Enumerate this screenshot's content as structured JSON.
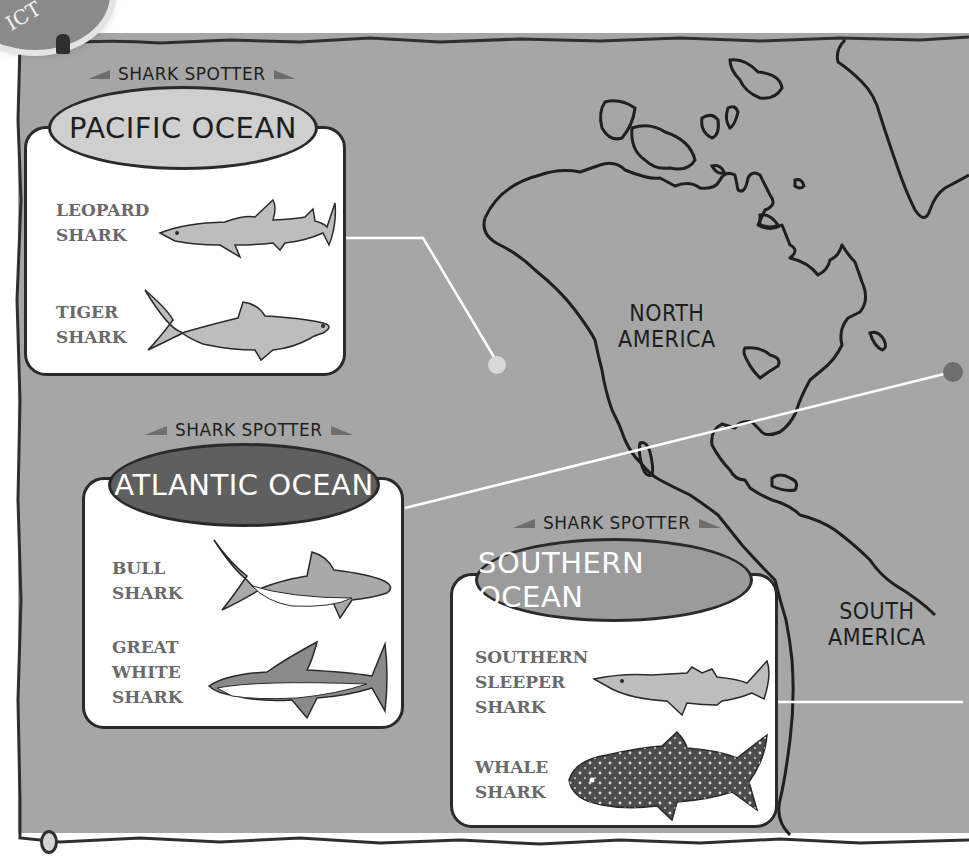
{
  "page": {
    "corner_badge_text": "ICT",
    "top_caption": "",
    "colors": {
      "ocean": "#a6a6a6",
      "card": "#ffffff",
      "outline": "#2a2a2a",
      "pacific_header": "#cfcfcf",
      "atlantic_header": "#5f5f5f",
      "southern_header": "#9b9b9b",
      "shark_label": "#6a6a6a",
      "pointer_line": "#ffffff"
    }
  },
  "map": {
    "continents": [
      {
        "label_line1": "NORTH",
        "label_line2": "AMERICA"
      },
      {
        "label_line1": "SOUTH",
        "label_line2": "AMERICA"
      }
    ],
    "markers": [
      {
        "name": "pacific-marker",
        "color": "#d9d9d9"
      },
      {
        "name": "atlantic-marker",
        "color": "#6e6e6e"
      },
      {
        "name": "southern-marker",
        "color": "#e0e0e0"
      }
    ]
  },
  "cards": {
    "pacific": {
      "spotter": "SHARK SPOTTER",
      "title": "PACIFIC OCEAN",
      "sharks": [
        {
          "line1": "LEOPARD",
          "line2": "SHARK",
          "icon": "leopard-shark-icon"
        },
        {
          "line1": "TIGER",
          "line2": "SHARK",
          "icon": "tiger-shark-icon"
        }
      ]
    },
    "atlantic": {
      "spotter": "SHARK SPOTTER",
      "title": "ATLANTIC OCEAN",
      "sharks": [
        {
          "line1": "BULL",
          "line2": "SHARK",
          "icon": "bull-shark-icon"
        },
        {
          "line1": "GREAT",
          "line2": "WHITE",
          "line3": "SHARK",
          "icon": "great-white-shark-icon"
        }
      ]
    },
    "southern": {
      "spotter": "SHARK SPOTTER",
      "title": "SOUTHERN OCEAN",
      "sharks": [
        {
          "line1": "SOUTHERN",
          "line2": "SLEEPER",
          "line3": "SHARK",
          "icon": "southern-sleeper-shark-icon"
        },
        {
          "line1": "WHALE",
          "line2": "SHARK",
          "icon": "whale-shark-icon"
        }
      ]
    }
  }
}
